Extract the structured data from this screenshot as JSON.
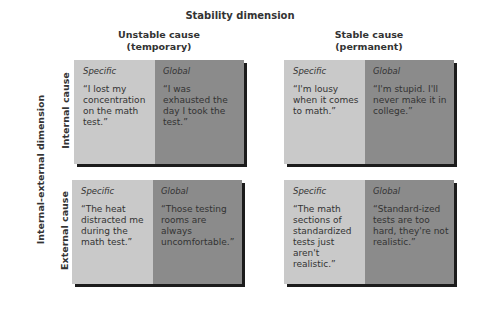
{
  "title": "Stability dimension",
  "columns": [
    {
      "label_line1": "Unstable cause",
      "label_line2": "(temporary)"
    },
    {
      "label_line1": "Stable cause",
      "label_line2": "(permanent)"
    }
  ],
  "row_axis_title": "Internal-external dimension",
  "rows": [
    {
      "label": "Internal cause"
    },
    {
      "label": "External cause"
    }
  ],
  "cells": {
    "internal_unstable": {
      "specific_label": "Specific",
      "specific_quote": "“I lost my concentration on the math test.”",
      "global_label": "Global",
      "global_quote": "“I was exhausted the day I took the test.”"
    },
    "internal_stable": {
      "specific_label": "Specific",
      "specific_quote": "“I'm lousy when it comes to math.”",
      "global_label": "Global",
      "global_quote": "“I'm stupid. I'll never make it in college.”"
    },
    "external_unstable": {
      "specific_label": "Specific",
      "specific_quote": "“The heat distracted me during the math test.”",
      "global_label": "Global",
      "global_quote": "“Those testing rooms are always uncomfortable.”"
    },
    "external_stable": {
      "specific_label": "Specific",
      "specific_quote": "“The math sections of standardized tests just aren't realistic.”",
      "global_label": "Global",
      "global_quote": "“Standard-ized tests are too hard, they're not realistic.”"
    }
  },
  "colors": {
    "specific_bg": "#c9c9c9",
    "global_bg": "#8b8b8b",
    "shadow": "#1c1c1c"
  }
}
